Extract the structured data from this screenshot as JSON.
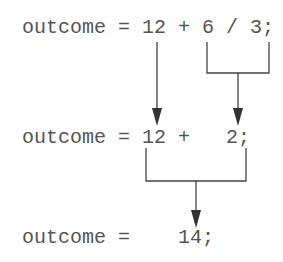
{
  "lines": [
    {
      "text": "outcome = 12 + 6 / 3;"
    },
    {
      "text": "outcome = 12 +   2;"
    },
    {
      "text": "outcome =    14;"
    }
  ],
  "colors": {
    "text": "#555555",
    "lines": "#444444",
    "background": "#ffffff"
  }
}
